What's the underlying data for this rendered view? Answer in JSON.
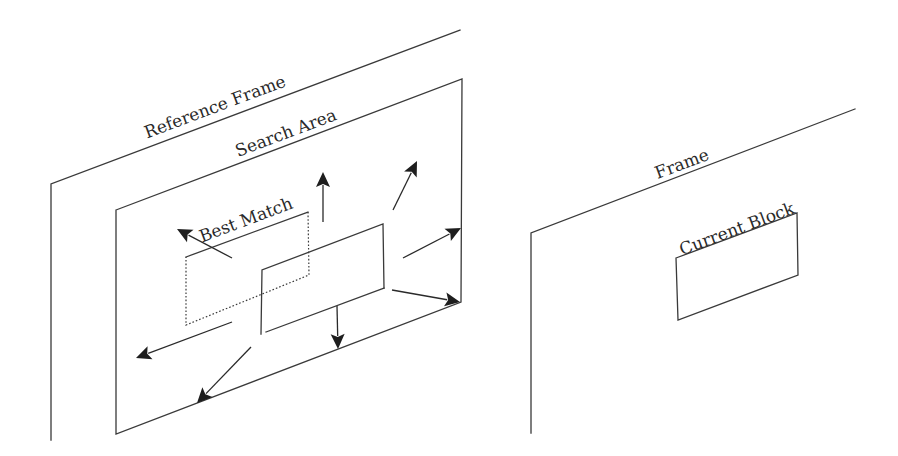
{
  "diagram": {
    "type": "block-matching motion estimation",
    "slope_deg": -20.6,
    "stroke_color": "#3a3a3a",
    "arrow_color": "#1e1e1e",
    "labels": {
      "reference_frame": "Reference Frame",
      "search_area": "Search Area",
      "best_match": "Best Match",
      "frame": "Frame",
      "current_block": "Current Block"
    },
    "reference_frame": {
      "top_edge": [
        [
          51,
          184
        ],
        [
          460,
          30
        ]
      ],
      "left_edge": [
        [
          51,
          184
        ],
        [
          51,
          440
        ]
      ]
    },
    "search_area": {
      "corners": [
        [
          116,
          210
        ],
        [
          462,
          79
        ],
        [
          461,
          302
        ],
        [
          116,
          434
        ]
      ]
    },
    "best_match_block": {
      "style": "dotted",
      "corners": [
        [
          186,
          257
        ],
        [
          308,
          212
        ],
        [
          309,
          275
        ],
        [
          186,
          325
        ]
      ]
    },
    "candidate_block": {
      "corners": [
        [
          262,
          270
        ],
        [
          383,
          224
        ],
        [
          384,
          288
        ],
        [
          262,
          334
        ]
      ]
    },
    "search_arrows": [
      {
        "name": "up-left",
        "from": [
          232,
          258
        ],
        "to": [
          177,
          229
        ]
      },
      {
        "name": "up",
        "from": [
          323,
          222
        ],
        "to": [
          323,
          172
        ]
      },
      {
        "name": "up-right",
        "from": [
          393,
          210
        ],
        "to": [
          417,
          161
        ]
      },
      {
        "name": "right",
        "from": [
          403,
          258
        ],
        "to": [
          461,
          228
        ]
      },
      {
        "name": "down-right",
        "from": [
          392,
          290
        ],
        "to": [
          460,
          302
        ]
      },
      {
        "name": "down",
        "from": [
          337,
          306
        ],
        "to": [
          338,
          349
        ]
      },
      {
        "name": "down-left",
        "from": [
          251,
          347
        ],
        "to": [
          197,
          403
        ]
      },
      {
        "name": "left",
        "from": [
          232,
          322
        ],
        "to": [
          136,
          358
        ]
      }
    ],
    "current_frame": {
      "top_edge": [
        [
          531,
          233
        ],
        [
          855,
          109
        ]
      ],
      "left_edge": [
        [
          531,
          233
        ],
        [
          531,
          433
        ]
      ]
    },
    "current_block": {
      "corners": [
        [
          676,
          258
        ],
        [
          797,
          213
        ],
        [
          798,
          275
        ],
        [
          678,
          320
        ]
      ]
    }
  }
}
